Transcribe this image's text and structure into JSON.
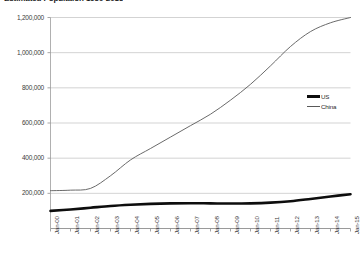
{
  "chart_data": {
    "type": "line",
    "title": "Estimated Population 1950-2015",
    "title_truncated": true,
    "xlabel": "",
    "ylabel": "",
    "ylim": [
      0,
      1200000
    ],
    "ytick_labels": [
      "200,000",
      "400,000",
      "600,000",
      "800,000",
      "1,000,000",
      "1,200,000"
    ],
    "ytick_values": [
      200000,
      400000,
      600000,
      800000,
      1000000,
      1200000
    ],
    "grid": true,
    "grid_axis": "y",
    "legend_position": "right",
    "categories": [
      "Jan-00",
      "Jan-01",
      "Jan-02",
      "Jan-03",
      "Jan-04",
      "Jan-05",
      "Jan-06",
      "Jan-07",
      "Jan-08",
      "Jan-09",
      "Jan-10",
      "Jan-11",
      "Jan-12",
      "Jan-13",
      "Jan-14",
      "Jan-15"
    ],
    "series": [
      {
        "name": "US",
        "color": "#0d0d0d",
        "style": "thick-solid",
        "values": [
          100000,
          108000,
          118000,
          128000,
          135000,
          140000,
          143000,
          144000,
          143000,
          142000,
          143000,
          147000,
          155000,
          168000,
          182000,
          195000
        ]
      },
      {
        "name": "China",
        "color": "#595959",
        "style": "thin-solid",
        "values": [
          215000,
          218000,
          228000,
          300000,
          390000,
          455000,
          520000,
          585000,
          650000,
          730000,
          820000,
          925000,
          1035000,
          1120000,
          1170000,
          1200000
        ]
      }
    ]
  },
  "legend": {
    "items": [
      {
        "label": "US"
      },
      {
        "label": "China"
      }
    ]
  }
}
